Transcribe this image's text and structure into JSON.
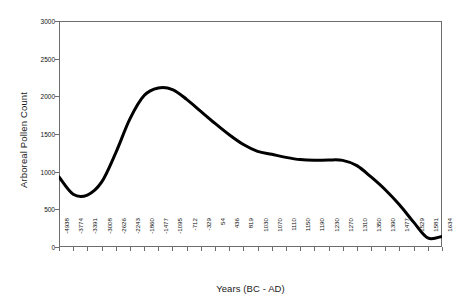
{
  "chart_data": {
    "type": "line",
    "title": "",
    "xlabel": "Years (BC - AD)",
    "ylabel": "Arboreal Pollen Count",
    "ylim": [
      0,
      3000
    ],
    "yticks": [
      0,
      500,
      1000,
      1500,
      2000,
      2500,
      3000
    ],
    "ytick_labels": [
      "0",
      "500",
      "1000",
      "1500",
      "2000",
      "2500",
      "3000"
    ],
    "grid": false,
    "legend": false,
    "line_color": "#000000",
    "line_width": 3,
    "categories": [
      "-4938",
      "-3774",
      "-3391",
      "-3008",
      "-2626",
      "-2243",
      "-1860",
      "-1477",
      "-1095",
      "-712",
      "-329",
      "54",
      "436",
      "819",
      "1030",
      "1070",
      "1110",
      "1150",
      "1190",
      "1230",
      "1270",
      "1310",
      "1350",
      "1390",
      "1477",
      "1529",
      "1581",
      "1634"
    ],
    "values": [
      930,
      700,
      690,
      860,
      1250,
      1700,
      2010,
      2110,
      2090,
      1960,
      1800,
      1640,
      1490,
      1360,
      1270,
      1230,
      1190,
      1160,
      1150,
      1155,
      1150,
      1080,
      930,
      760,
      560,
      330,
      120,
      140
    ],
    "series": [
      {
        "name": "Arboreal Pollen Count",
        "values": [
          930,
          700,
          690,
          860,
          1250,
          1700,
          2010,
          2110,
          2090,
          1960,
          1800,
          1640,
          1490,
          1360,
          1270,
          1230,
          1190,
          1160,
          1150,
          1155,
          1150,
          1080,
          930,
          760,
          560,
          330,
          120,
          140
        ]
      }
    ],
    "annotations": []
  },
  "axes": {
    "frame_color": "#6d6d6d",
    "background": "#ffffff"
  }
}
